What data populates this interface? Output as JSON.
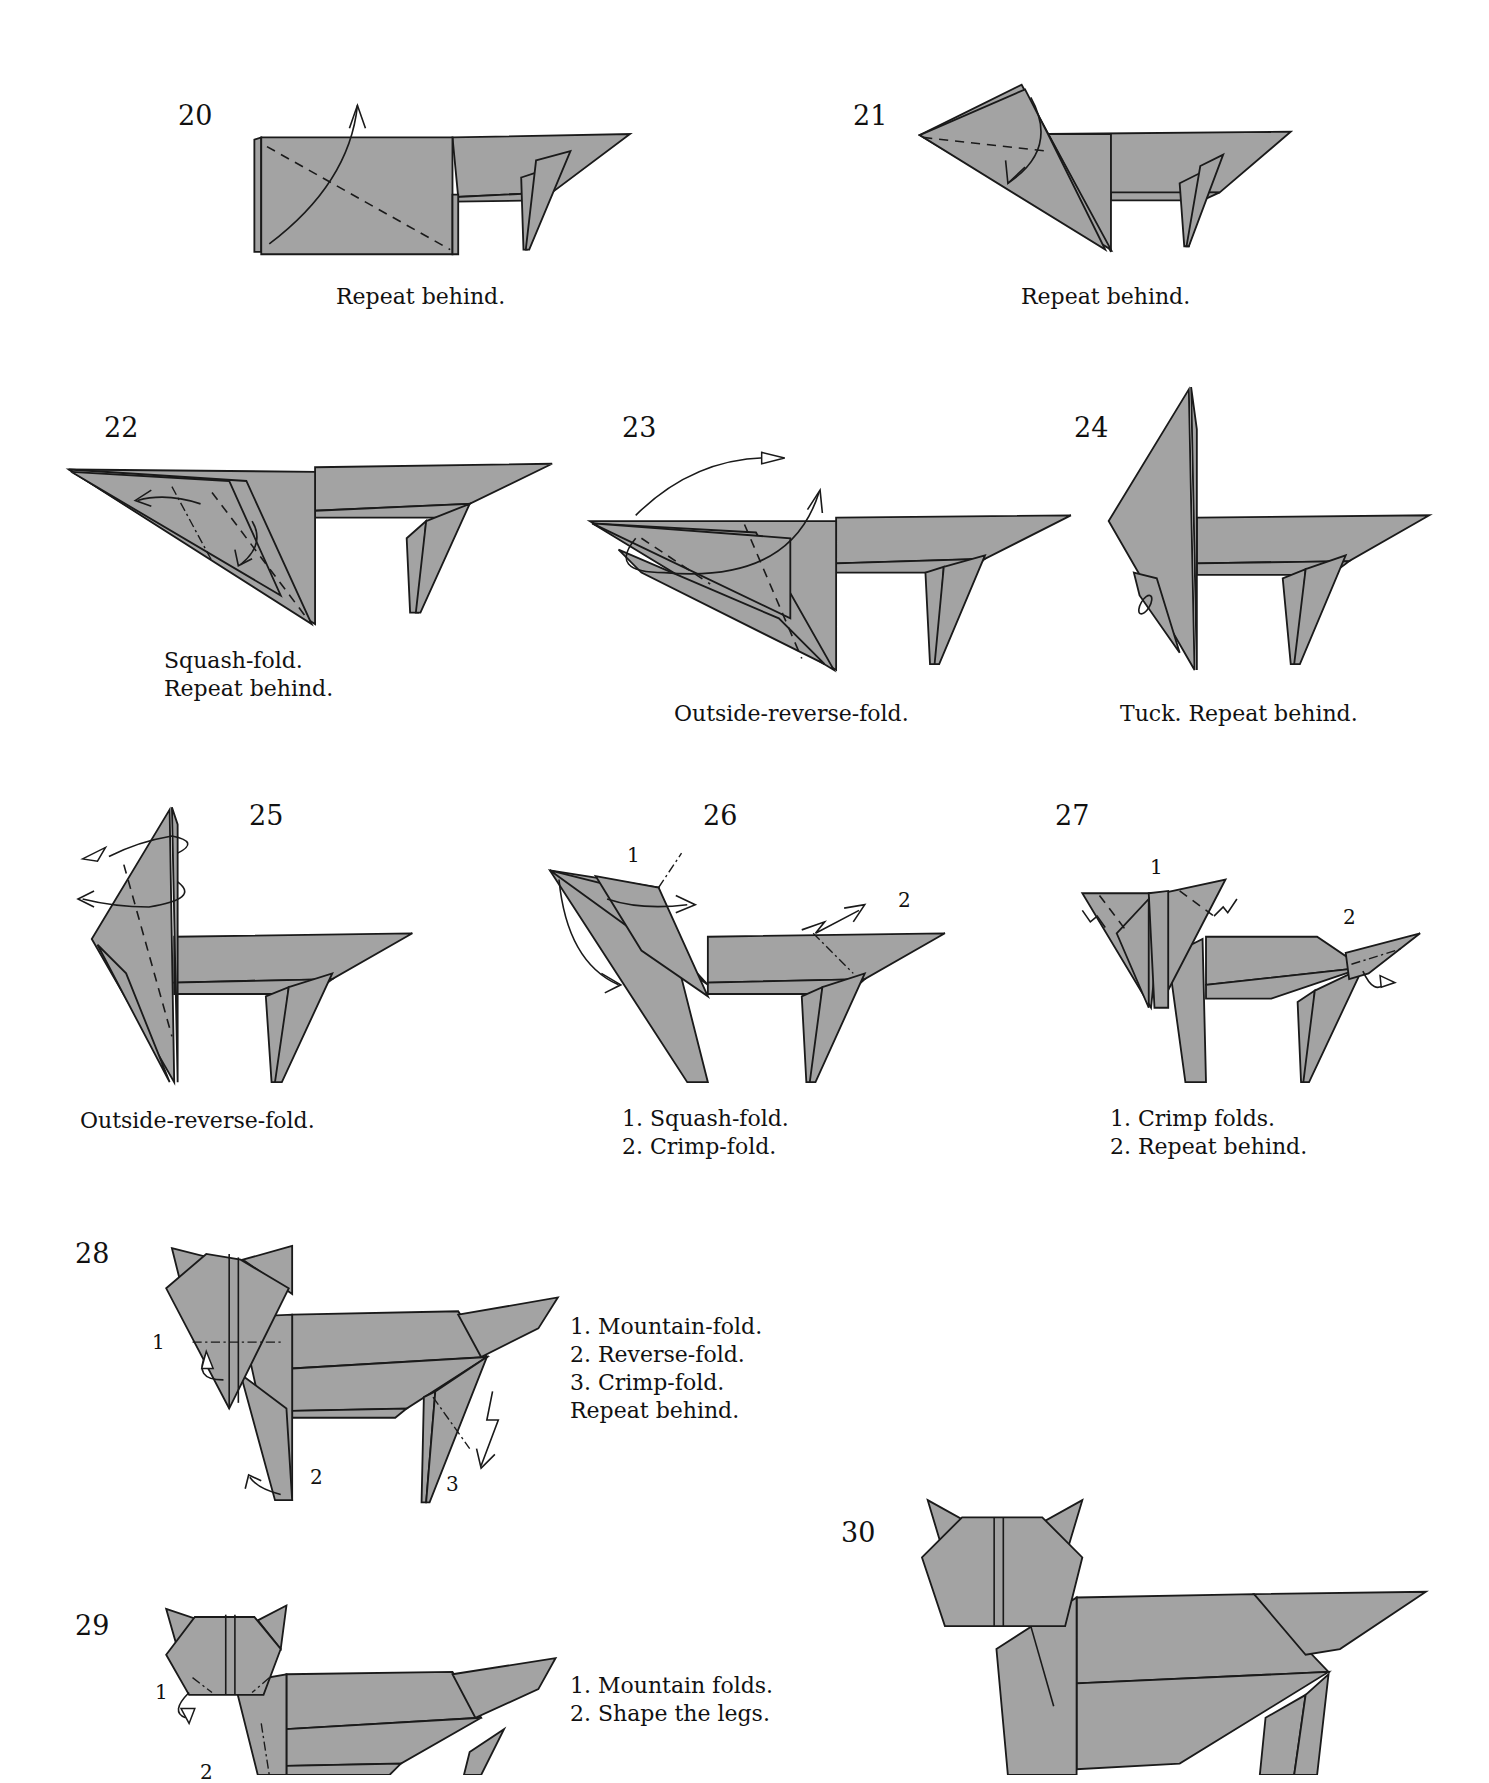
{
  "document": {
    "type": "origami-diagram-page",
    "subject": "origami cat folding steps 20-30"
  },
  "steps": [
    {
      "number": "20",
      "caption": [
        "Repeat behind."
      ]
    },
    {
      "number": "21",
      "caption": [
        "Repeat behind."
      ]
    },
    {
      "number": "22",
      "caption": [
        "Squash-fold.",
        "Repeat behind."
      ]
    },
    {
      "number": "23",
      "caption": [
        "Outside-reverse-fold."
      ]
    },
    {
      "number": "24",
      "caption": [
        "Tuck. Repeat behind."
      ]
    },
    {
      "number": "25",
      "caption": [
        "Outside-reverse-fold."
      ]
    },
    {
      "number": "26",
      "caption": [
        "1. Squash-fold.",
        "2. Crimp-fold."
      ],
      "labels": [
        "1",
        "2"
      ]
    },
    {
      "number": "27",
      "caption": [
        "1. Crimp folds.",
        "2. Repeat behind."
      ],
      "labels": [
        "1",
        "2"
      ]
    },
    {
      "number": "28",
      "caption": [
        "1. Mountain-fold.",
        "2. Reverse-fold.",
        "3. Crimp-fold.",
        "Repeat behind."
      ],
      "labels": [
        "1",
        "2",
        "3"
      ]
    },
    {
      "number": "29",
      "caption": [
        "1. Mountain folds.",
        "2. Shape the legs."
      ],
      "labels": [
        "1",
        "2"
      ]
    },
    {
      "number": "30",
      "caption": []
    }
  ],
  "colors": {
    "paper": "#a3a3a3",
    "line": "#1a1a1a",
    "background": "#ffffff"
  }
}
